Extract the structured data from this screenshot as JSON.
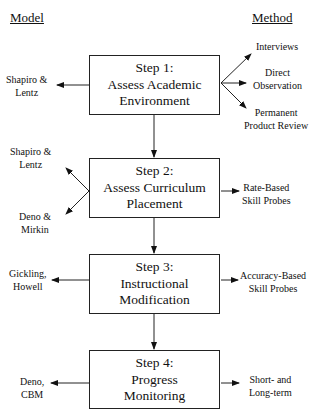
{
  "headers": {
    "model": "Model",
    "method": "Method"
  },
  "steps": [
    {
      "title": "Step 1:",
      "line1": "Assess Academic",
      "line2": "Environment",
      "models": [
        {
          "line1": "Shapiro &",
          "line2": "Lentz"
        }
      ],
      "methods": [
        {
          "line1": "Interviews",
          "line2": ""
        },
        {
          "line1": "Direct",
          "line2": "Observation"
        },
        {
          "line1": "Permanent",
          "line2": "Product Review"
        }
      ]
    },
    {
      "title": "Step 2:",
      "line1": "Assess Curriculum",
      "line2": "Placement",
      "models": [
        {
          "line1": "Shapiro &",
          "line2": "Lentz"
        },
        {
          "line1": "Deno &",
          "line2": "Mirkin"
        }
      ],
      "methods": [
        {
          "line1": "Rate-Based",
          "line2": "Skill Probes"
        }
      ]
    },
    {
      "title": "Step 3:",
      "line1": "Instructional",
      "line2": "Modification",
      "models": [
        {
          "line1": "Gickling,",
          "line2": "Howell"
        }
      ],
      "methods": [
        {
          "line1": "Accuracy-Based",
          "line2": "Skill Probes"
        }
      ]
    },
    {
      "title": "Step 4:",
      "line1": "Progress",
      "line2": "Monitoring",
      "models": [
        {
          "line1": "Deno,",
          "line2": "CBM"
        }
      ],
      "methods": [
        {
          "line1": "Short- and",
          "line2": "Long-term"
        }
      ]
    }
  ]
}
